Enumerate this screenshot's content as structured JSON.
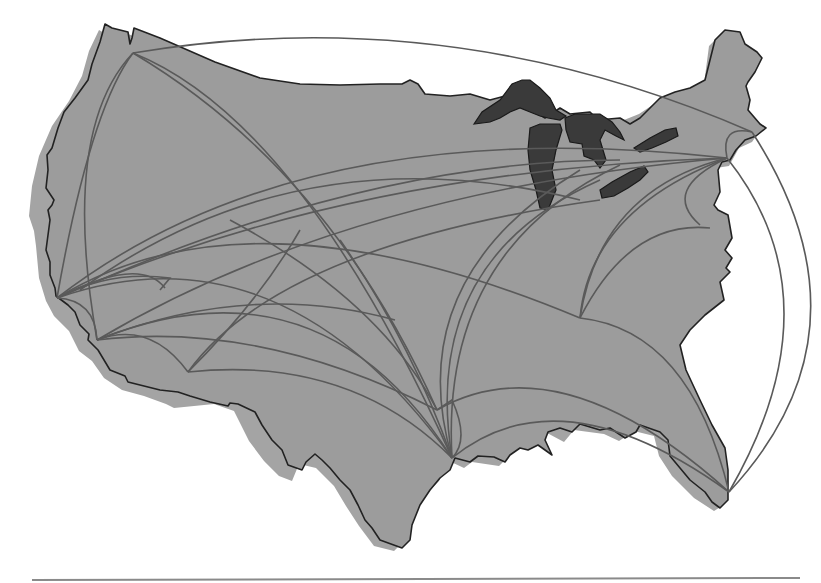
{
  "map": {
    "title": "",
    "subject": "United States flight route network",
    "colors": {
      "land": "#9c9c9c",
      "land_shadow": "#a4a4a4",
      "coastline": "#222222",
      "lakes": "#3a3a3a",
      "routes": "#5a5a5a",
      "background": "#ffffff",
      "rule": "#8a8a8a"
    },
    "hubs": [
      {
        "name": "seattle-hub",
        "x": 133,
        "y": 53
      },
      {
        "name": "san-francisco-hub",
        "x": 57,
        "y": 298
      },
      {
        "name": "los-angeles-hub",
        "x": 97,
        "y": 340
      },
      {
        "name": "las-vegas-hub",
        "x": 165,
        "y": 288
      },
      {
        "name": "phoenix-hub",
        "x": 188,
        "y": 372
      },
      {
        "name": "houston-hub",
        "x": 452,
        "y": 458
      },
      {
        "name": "atlanta-hub",
        "x": 580,
        "y": 318
      },
      {
        "name": "new-york-hub",
        "x": 727,
        "y": 158
      },
      {
        "name": "boston-hub",
        "x": 752,
        "y": 132
      },
      {
        "name": "miami-hub",
        "x": 729,
        "y": 492
      }
    ],
    "footer_rule": true
  }
}
